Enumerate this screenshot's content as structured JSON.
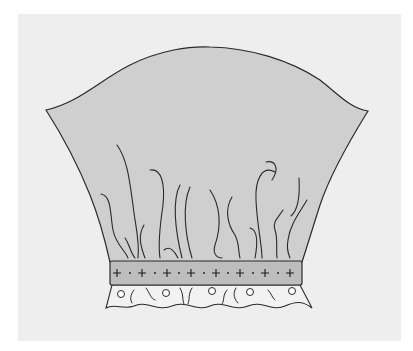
{
  "diagram": {
    "colors": {
      "background": "#eeeeee",
      "sleeve_fill": "#cfcfcf",
      "band_fill": "#bdbdbd",
      "ruffle_fill": "#f2f2f2",
      "outline": "#2a2a2a"
    },
    "parts": [
      {
        "name": "sleeve-cap",
        "label": ""
      },
      {
        "name": "gathers",
        "count": 18
      },
      {
        "name": "cuff-band",
        "markers": "+ · + · + · + · + · + · + · +",
        "plus_count": 8
      },
      {
        "name": "eyelet-ruffle",
        "eyelet_count": 5,
        "scallops": 5
      }
    ]
  }
}
